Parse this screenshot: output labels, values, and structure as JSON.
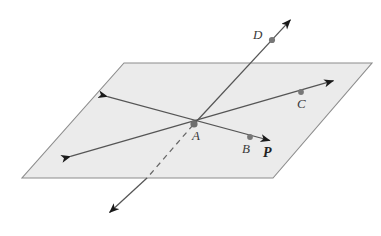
{
  "figure": {
    "type": "geometry-diagram",
    "canvas": {
      "width": 381,
      "height": 236
    },
    "colors": {
      "plane_fill": "#ebebeb",
      "plane_stroke": "#8c8c8c",
      "line_stroke": "#555555",
      "arrow_fill": "#1a1a1a",
      "point_fill": "#777777",
      "label_color": "#3a3a3a",
      "plane_label_color": "#222222",
      "background": "#ffffff"
    },
    "plane": {
      "name": "P",
      "corners": [
        {
          "x": 124,
          "y": 63
        },
        {
          "x": 372,
          "y": 63
        },
        {
          "x": 273,
          "y": 178
        },
        {
          "x": 22,
          "y": 178
        }
      ]
    },
    "points": [
      {
        "label": "A",
        "dot": {
          "x": 194,
          "y": 124
        },
        "label_pos": {
          "x": 192,
          "y": 129
        },
        "in_plane": true
      },
      {
        "label": "B",
        "dot": {
          "x": 250,
          "y": 137
        },
        "label_pos": {
          "x": 242,
          "y": 142
        },
        "in_plane": true
      },
      {
        "label": "C",
        "dot": {
          "x": 301,
          "y": 92
        },
        "label_pos": {
          "x": 297,
          "y": 97
        },
        "in_plane": true
      },
      {
        "label": "D",
        "dot": {
          "x": 272,
          "y": 40
        },
        "label_pos": {
          "x": 253,
          "y": 28
        },
        "in_plane": false
      }
    ],
    "plane_label": {
      "text": "P",
      "x": 263,
      "y": 146
    },
    "lines": [
      {
        "name": "line-A-B-P",
        "from": {
          "x": 105,
          "y": 96
        },
        "to": {
          "x": 272,
          "y": 141
        },
        "style": "solid",
        "arrows": "both"
      },
      {
        "name": "line-A-C",
        "from": {
          "x": 68,
          "y": 157
        },
        "to": {
          "x": 336,
          "y": 80
        },
        "style": "solid",
        "arrows": "both"
      },
      {
        "name": "line-A-D-piercing",
        "solid_upper": {
          "from": {
            "x": 194,
            "y": 124
          },
          "to": {
            "x": 293,
            "y": 17
          }
        },
        "dashed_lower": {
          "from": {
            "x": 194,
            "y": 124
          },
          "to": {
            "x": 147,
            "y": 178
          }
        },
        "solid_lower": {
          "from": {
            "x": 147,
            "y": 178
          },
          "to": {
            "x": 107,
            "y": 215
          }
        },
        "style": "mixed",
        "arrows": "both"
      }
    ]
  }
}
